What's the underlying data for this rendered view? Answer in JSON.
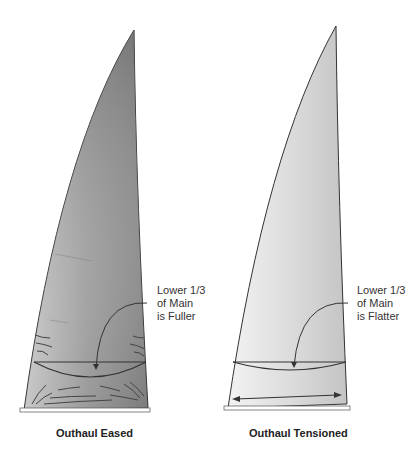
{
  "figure": {
    "panels": [
      {
        "id": "eased",
        "caption": "Outhaul Eased",
        "annotation": [
          "Lower 1/3",
          "of Main",
          "is Fuller"
        ]
      },
      {
        "id": "tensioned",
        "caption": "Outhaul Tensioned",
        "annotation": [
          "Lower 1/3",
          "of Main",
          "is Flatter"
        ]
      }
    ],
    "colors": {
      "sail_dark": "#7a7a7a",
      "sail_light": "#e6e6e6",
      "outline": "#333333"
    }
  }
}
